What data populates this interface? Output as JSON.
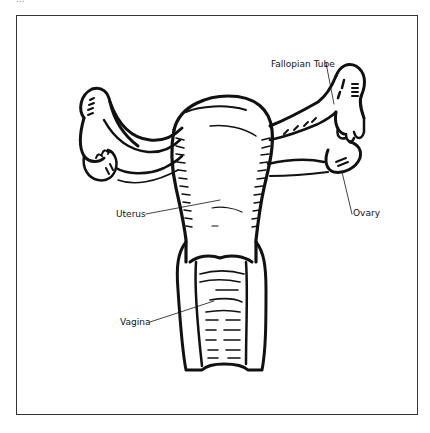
{
  "header": {
    "caption_fragment": "..."
  },
  "diagram": {
    "labels": {
      "fallopian_tube": "Fallopian Tube",
      "ovary": "Ovary",
      "uterus": "Uterus",
      "vagina": "Vagina"
    },
    "colors": {
      "line": "#111111",
      "frame": "#333333",
      "background": "#ffffff"
    }
  }
}
